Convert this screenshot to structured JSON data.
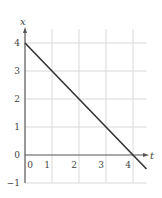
{
  "chart_data": {
    "type": "line",
    "title": "",
    "xlabel": "t",
    "ylabel": "x",
    "xlim": [
      0,
      4.5
    ],
    "ylim": [
      -1,
      4
    ],
    "grid": true,
    "x_ticks": [
      "0",
      "1",
      "2",
      "3",
      "4"
    ],
    "y_ticks": [
      "4",
      "3",
      "2",
      "1",
      "0",
      "−1"
    ],
    "series": [
      {
        "name": "x(t)",
        "x": [
          0,
          4.5
        ],
        "y": [
          4,
          -0.5
        ],
        "color": "#333333"
      }
    ]
  },
  "labels": {
    "x_axis": "t",
    "y_axis": "x"
  },
  "colors": {
    "grid": "#d8d8d8",
    "axis": "#555555",
    "line": "#333333"
  }
}
